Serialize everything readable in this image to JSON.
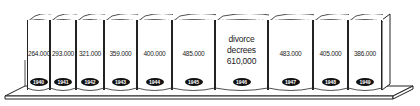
{
  "chart_data": {
    "type": "bar",
    "title": "",
    "annotation": "divorce decrees",
    "categories": [
      "1940",
      "1941",
      "1942",
      "1943",
      "1944",
      "1945",
      "1946",
      "1947",
      "1948",
      "1949"
    ],
    "values": [
      264000,
      293000,
      321000,
      359000,
      400000,
      485000,
      610000,
      483000,
      405000,
      386000
    ],
    "labels": [
      "264.000",
      "293.000",
      "321.000",
      "359.000",
      "400.000",
      "485.000",
      "610,000",
      "483.000",
      "405.000",
      "386.000"
    ],
    "xlabel": "",
    "ylabel": "divorce decrees",
    "grid": false,
    "legend": null,
    "style": "pictograph: books on a shelf, book width proportional to value"
  },
  "books": [
    {
      "year": "1940",
      "label": "264.000",
      "x": 27,
      "w": 23
    },
    {
      "year": "1941",
      "label": "293.000",
      "x": 50,
      "w": 26
    },
    {
      "year": "1942",
      "label": "321.000",
      "x": 76,
      "w": 28
    },
    {
      "year": "1943",
      "label": "359.000",
      "x": 104,
      "w": 33
    },
    {
      "year": "1944",
      "label": "400.000",
      "x": 137,
      "w": 35
    },
    {
      "year": "1945",
      "label": "485.000",
      "x": 172,
      "w": 43
    },
    {
      "year": "1946",
      "label": "610,000",
      "x": 215,
      "w": 53,
      "caption1": "divorce",
      "caption2": "decrees"
    },
    {
      "year": "1947",
      "label": "483.000",
      "x": 268,
      "w": 45
    },
    {
      "year": "1948",
      "label": "405.000",
      "x": 313,
      "w": 35
    },
    {
      "year": "1949",
      "label": "386.000",
      "x": 348,
      "w": 34
    }
  ],
  "colors": {
    "ink": "#222222",
    "background": "#ffffff",
    "badge": "#111111"
  }
}
